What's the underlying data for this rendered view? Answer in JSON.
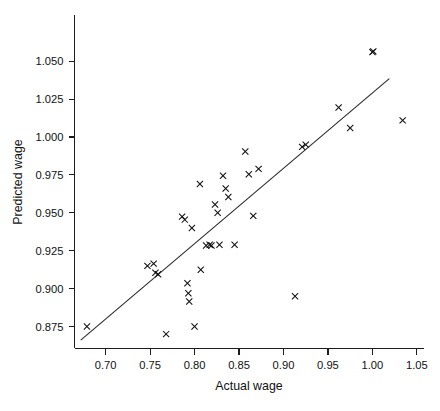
{
  "chart_data": {
    "type": "scatter",
    "title": "",
    "xlabel": "Actual wage",
    "ylabel": "Predicted wage",
    "xlim": [
      0.665,
      1.058
    ],
    "ylim": [
      0.8605,
      1.0805
    ],
    "xticks": [
      0.7,
      0.75,
      0.8,
      0.85,
      0.9,
      0.95,
      1.0,
      1.05
    ],
    "xticklabels": [
      "0.70",
      "0.75",
      "0.80",
      "0.85",
      "0.90",
      "0.95",
      "1.00",
      "1.05"
    ],
    "yticks": [
      0.875,
      0.9,
      0.925,
      0.95,
      0.975,
      1.0,
      1.025,
      1.05
    ],
    "yticklabels": [
      "0.875",
      "0.900",
      "0.925",
      "0.950",
      "0.975",
      "1.000",
      "1.025",
      "1.050"
    ],
    "grid": false,
    "legend": null,
    "marker": "x",
    "marker_color": "#111111",
    "series": [
      {
        "name": "Predicted vs actual wage",
        "points": [
          [
            0.679,
            0.875
          ],
          [
            0.747,
            0.915
          ],
          [
            0.754,
            0.9165
          ],
          [
            0.756,
            0.9105
          ],
          [
            0.759,
            0.9095
          ],
          [
            0.768,
            0.87
          ],
          [
            0.786,
            0.9475
          ],
          [
            0.789,
            0.9455
          ],
          [
            0.792,
            0.9035
          ],
          [
            0.793,
            0.897
          ],
          [
            0.794,
            0.8915
          ],
          [
            0.797,
            0.94
          ],
          [
            0.8,
            0.875
          ],
          [
            0.806,
            0.969
          ],
          [
            0.807,
            0.9125
          ],
          [
            0.813,
            0.9285
          ],
          [
            0.817,
            0.929
          ],
          [
            0.819,
            0.9285
          ],
          [
            0.823,
            0.9555
          ],
          [
            0.826,
            0.95
          ],
          [
            0.828,
            0.929
          ],
          [
            0.832,
            0.9745
          ],
          [
            0.835,
            0.966
          ],
          [
            0.838,
            0.9605
          ],
          [
            0.845,
            0.929
          ],
          [
            0.857,
            0.9905
          ],
          [
            0.861,
            0.9755
          ],
          [
            0.866,
            0.948
          ],
          [
            0.872,
            0.979
          ],
          [
            0.913,
            0.895
          ],
          [
            0.921,
            0.9935
          ],
          [
            0.925,
            0.995
          ],
          [
            0.962,
            1.0195
          ],
          [
            0.975,
            1.006
          ],
          [
            1.0,
            1.056
          ],
          [
            1.001,
            1.0565
          ],
          [
            1.034,
            1.011
          ]
        ]
      }
    ],
    "fit_line": {
      "name": "regression line",
      "x": [
        0.672,
        1.019
      ],
      "y": [
        0.866,
        1.0385
      ]
    }
  }
}
